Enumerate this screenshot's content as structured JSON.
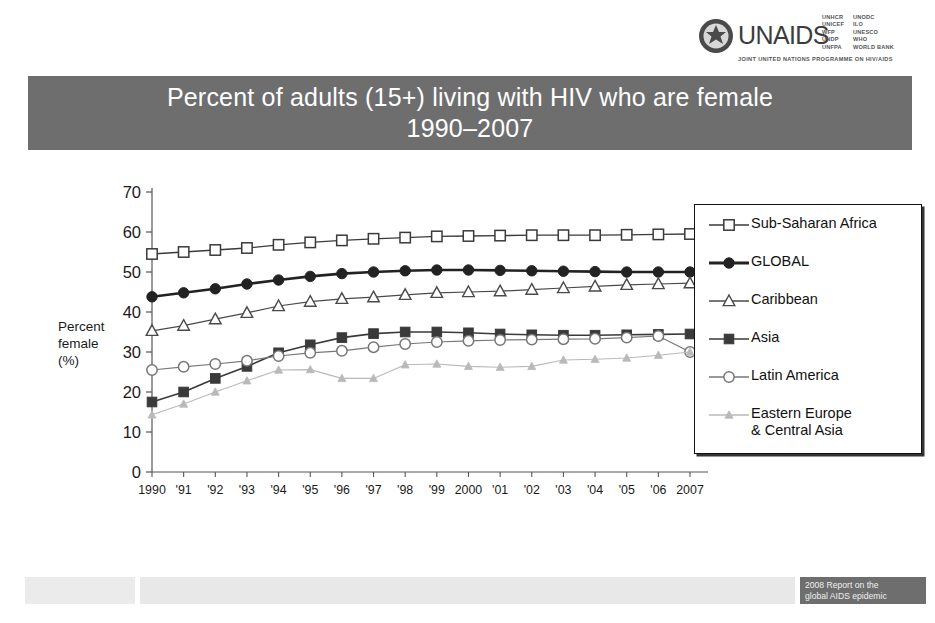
{
  "logo": {
    "wordmark": "UNAIDS",
    "tagline": "JOINT UNITED NATIONS PROGRAMME ON HIV/AIDS",
    "agencies_left": "UNHCR\nUNICEF\nWFP\nUNDP\nUNFPA",
    "agencies_right": "UNODC\nILO\nUNESCO\nWHO\nWORLD BANK"
  },
  "title": {
    "line1": "Percent of adults (15+) living with HIV who are female",
    "line2": "1990–2007"
  },
  "y_axis_title": "Percent\nfemale\n(%)",
  "footer": {
    "tag_line1": "2008 Report on the",
    "tag_line2": "global AIDS epidemic"
  },
  "colors": {
    "banner": "#6e6e6e",
    "sub_saharan_africa": "#3a3a3a",
    "global": "#222222",
    "caribbean": "#4a4a4a",
    "asia": "#3a3a3a",
    "latin_america": "#777777",
    "eastern_europe": "#b9b9b9"
  },
  "chart_data": {
    "type": "line",
    "xlabel": "",
    "ylabel": "Percent female (%)",
    "ylim": [
      0,
      70
    ],
    "yticks": [
      0,
      10,
      20,
      30,
      40,
      50,
      60,
      70
    ],
    "grid": false,
    "legend_position": "right",
    "x": [
      1990,
      1991,
      1992,
      1993,
      1994,
      1995,
      1996,
      1997,
      1998,
      1999,
      2000,
      2001,
      2002,
      2003,
      2004,
      2005,
      2006,
      2007
    ],
    "categories": [
      "1990",
      "'91",
      "'92",
      "'93",
      "'94",
      "'95",
      "'96",
      "'97",
      "'98",
      "'99",
      "2000",
      "'01",
      "'02",
      "'03",
      "'04",
      "'05",
      "'06",
      "2007"
    ],
    "series": [
      {
        "name": "Sub-Saharan Africa",
        "marker": "open-square",
        "values": [
          54.5,
          55.0,
          55.5,
          56.0,
          56.8,
          57.4,
          57.9,
          58.3,
          58.6,
          58.9,
          59.0,
          59.1,
          59.2,
          59.2,
          59.2,
          59.3,
          59.4,
          59.5
        ]
      },
      {
        "name": "GLOBAL",
        "marker": "filled-circle",
        "values": [
          43.8,
          44.8,
          45.8,
          47.0,
          48.0,
          48.9,
          49.6,
          50.0,
          50.3,
          50.5,
          50.5,
          50.4,
          50.3,
          50.2,
          50.1,
          50.0,
          50.0,
          50.0
        ]
      },
      {
        "name": "Caribbean",
        "marker": "open-triangle",
        "values": [
          35.3,
          36.6,
          38.2,
          39.8,
          41.5,
          42.6,
          43.3,
          43.7,
          44.3,
          44.8,
          45.0,
          45.2,
          45.6,
          46.0,
          46.4,
          46.8,
          47.0,
          47.2
        ]
      },
      {
        "name": "Asia",
        "marker": "filled-square",
        "values": [
          17.5,
          20.0,
          23.4,
          26.4,
          29.8,
          31.8,
          33.6,
          34.6,
          35.0,
          35.0,
          34.8,
          34.5,
          34.3,
          34.2,
          34.2,
          34.3,
          34.4,
          34.5
        ]
      },
      {
        "name": "Latin America",
        "marker": "open-circle",
        "values": [
          25.5,
          26.3,
          27.0,
          27.8,
          29.0,
          29.8,
          30.3,
          31.2,
          32.0,
          32.5,
          32.8,
          33.0,
          33.1,
          33.2,
          33.3,
          33.6,
          34.0,
          30.0
        ]
      },
      {
        "name": "Eastern Europe\n& Central Asia",
        "marker": "small-filled-triangle",
        "values": [
          14.3,
          17.0,
          20.0,
          22.8,
          25.5,
          25.6,
          23.4,
          23.4,
          26.8,
          27.0,
          26.4,
          26.2,
          26.4,
          28.0,
          28.2,
          28.5,
          29.2,
          30.0
        ]
      }
    ]
  }
}
